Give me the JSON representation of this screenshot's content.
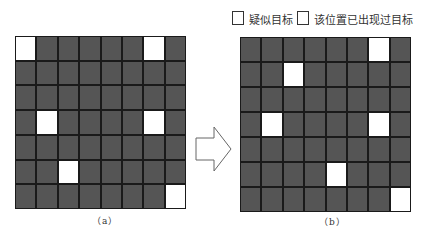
{
  "legend": {
    "items": [
      {
        "label": "疑似目标",
        "swatch": "#ffffff"
      },
      {
        "label": "该位置已出现过目标",
        "swatch": "#ffffff"
      }
    ]
  },
  "colors": {
    "occupied_cell": "#555555",
    "empty_highlight": "#ffffff",
    "grid_line": "#1a1a1a"
  },
  "panels": [
    {
      "caption": "（a）",
      "rows": 7,
      "cols": 8,
      "white_cells": [
        [
          0,
          0
        ],
        [
          0,
          6
        ],
        [
          3,
          1
        ],
        [
          3,
          6
        ],
        [
          5,
          2
        ],
        [
          6,
          7
        ]
      ]
    },
    {
      "caption": "（b）",
      "rows": 7,
      "cols": 8,
      "white_cells": [
        [
          0,
          6
        ],
        [
          1,
          2
        ],
        [
          3,
          1
        ],
        [
          3,
          6
        ],
        [
          5,
          4
        ],
        [
          6,
          7
        ]
      ]
    }
  ],
  "arrow": {
    "direction": "right",
    "icon": "hollow-arrow-right"
  }
}
